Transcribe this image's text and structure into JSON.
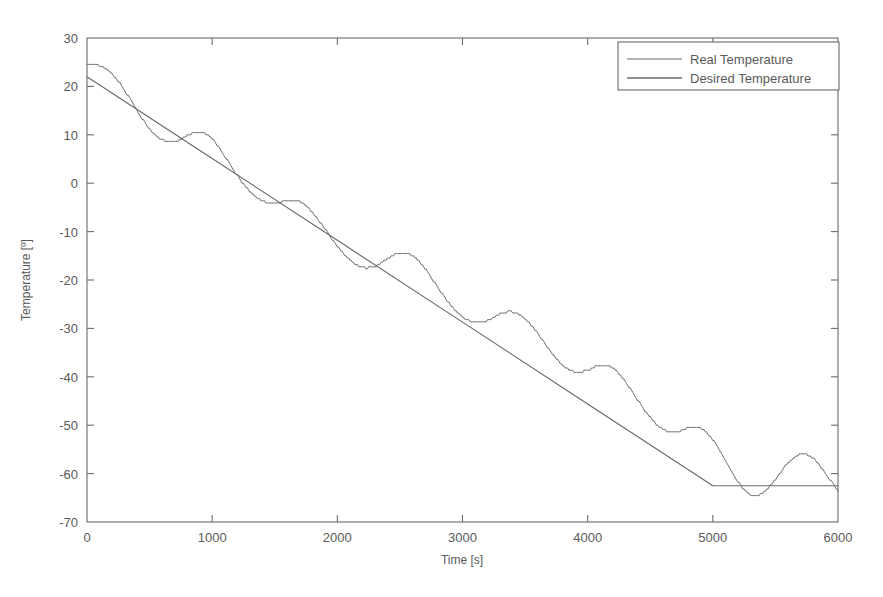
{
  "chart_data": {
    "type": "line",
    "title": "",
    "xlabel": "Time [s]",
    "ylabel": "Temperature [º]",
    "xlim": [
      0,
      6000
    ],
    "ylim": [
      -70,
      30
    ],
    "xticks": [
      0,
      1000,
      2000,
      3000,
      4000,
      5000,
      6000
    ],
    "xtick_labels": [
      "0",
      "1000",
      "2000",
      "3000",
      "4000",
      "5000",
      "6000"
    ],
    "yticks": [
      30,
      20,
      10,
      0,
      -10,
      -20,
      -30,
      -40,
      -50,
      -60,
      -70
    ],
    "ytick_labels": [
      "30",
      "20",
      "10",
      "0",
      "-10",
      "-20",
      "-30",
      "-40",
      "-50",
      "-60",
      "-70"
    ],
    "grid": false,
    "legend_position": "upper right",
    "legend_entries": [
      "Real Temperature",
      "Desired Temperature"
    ],
    "line_color": "#6a6a6a",
    "background_color": "#ffffff",
    "axis_color": "#6b6b6b",
    "series": [
      {
        "name": "Desired Temperature",
        "description": "Linear ramp from 22 at t=0 down to -62.5 at t=5000, then constant at -62.5 until t=6000",
        "x": [
          0,
          1000,
          2000,
          3000,
          4000,
          5000,
          6000
        ],
        "values": [
          22.0,
          5.1,
          -11.8,
          -28.7,
          -45.6,
          -62.5,
          -62.5
        ]
      },
      {
        "name": "Real Temperature",
        "description": "Oscillating response tracking the desired ramp with roughly +/-5 degree limit-cycle oscillations, period about 400 s",
        "x": [
          0,
          100,
          200,
          300,
          400,
          500,
          600,
          700,
          800,
          900,
          1000,
          1100,
          1200,
          1300,
          1400,
          1500,
          1600,
          1700,
          1800,
          1900,
          2000,
          2100,
          2200,
          2300,
          2400,
          2500,
          2600,
          2700,
          2800,
          2900,
          3000,
          3100,
          3200,
          3300,
          3400,
          3500,
          3600,
          3700,
          3800,
          3900,
          4000,
          4100,
          4200,
          4300,
          4400,
          4500,
          4600,
          4700,
          4800,
          4900,
          5000,
          5100,
          5200,
          5300,
          5400,
          5500,
          5600,
          5700,
          5800,
          5900,
          6000
        ],
        "values": [
          24.6,
          24.3,
          22.6,
          19.2,
          15.0,
          11.2,
          9.0,
          8.6,
          9.8,
          10.6,
          9.2,
          5.6,
          1.6,
          -1.6,
          -3.6,
          -4.2,
          -3.5,
          -3.8,
          -6.0,
          -9.4,
          -13.0,
          -15.8,
          -17.4,
          -17.2,
          -15.6,
          -14.4,
          -15.0,
          -17.6,
          -21.4,
          -25.0,
          -27.6,
          -28.8,
          -28.4,
          -27.0,
          -26.6,
          -28.0,
          -31.0,
          -34.6,
          -37.6,
          -39.0,
          -38.6,
          -37.6,
          -38.2,
          -41.0,
          -44.8,
          -48.4,
          -50.8,
          -51.4,
          -50.6,
          -50.6,
          -53.0,
          -57.4,
          -61.6,
          -64.4,
          -64.0,
          -61.2,
          -57.8,
          -56.0,
          -56.8,
          -60.0,
          -63.6
        ]
      }
    ]
  },
  "axis_titles": {
    "x": "Time [s]",
    "y": "Temperature [º]"
  },
  "legend": {
    "entries": [
      {
        "label": "Real Temperature"
      },
      {
        "label": "Desired Temperature"
      }
    ]
  }
}
